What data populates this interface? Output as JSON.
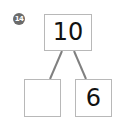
{
  "problem_number": "14",
  "number_bond": {
    "whole": "10",
    "part_left": "",
    "part_right": "6"
  },
  "colors": {
    "box_border": "#b8b8b8",
    "connector": "#808080",
    "badge": "#6b6b6b",
    "text": "#111111"
  }
}
